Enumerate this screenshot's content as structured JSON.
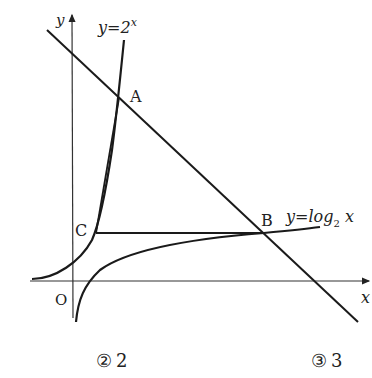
{
  "diagram": {
    "axes": {
      "x_label": "x",
      "y_label": "y",
      "origin_label": "O"
    },
    "curves": {
      "exp": {
        "label_prefix": "y=2",
        "label_exp": "x"
      },
      "log": {
        "label_prefix": "y=log",
        "label_sub": "2",
        "label_var": " x"
      }
    },
    "points": {
      "A": "A",
      "B": "B",
      "C": "C"
    }
  },
  "choices": [
    {
      "marker": "②",
      "value": "2"
    },
    {
      "marker": "③",
      "value": "3"
    }
  ],
  "colors": {
    "ink": "#222222",
    "background": "#ffffff"
  }
}
